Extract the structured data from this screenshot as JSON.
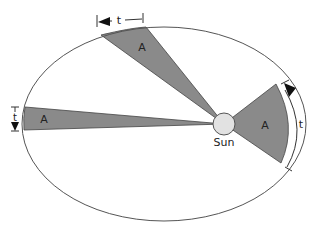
{
  "diagram": {
    "sun_label": "Sun",
    "sectors": [
      {
        "id": "top",
        "area_label": "A",
        "time_label": "t"
      },
      {
        "id": "left",
        "area_label": "A",
        "time_label": "t"
      },
      {
        "id": "right",
        "area_label": "A",
        "time_label": "t"
      }
    ],
    "colors": {
      "sector_fill": "#8a8a8a",
      "orbit_stroke": "#555555",
      "sun_fill": "#e2e2e2",
      "background": "#ffffff"
    }
  }
}
